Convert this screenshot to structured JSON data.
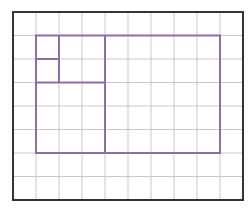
{
  "diagram": {
    "type": "grid-partition",
    "grid": {
      "columns": 10,
      "rows": 8,
      "origin_x": 13,
      "origin_y": 12,
      "cell_width": 23,
      "cell_height": 23.5,
      "gridline_color": "#c9c9c9",
      "border_color": "#333333"
    },
    "shapes": {
      "color": "#8a6fa0",
      "outer_rect": {
        "col": 1,
        "row": 1,
        "cols": 8,
        "rows": 5
      },
      "segments": [
        {
          "name": "divider-vertical-main",
          "x1c": 4,
          "y1r": 1,
          "x2c": 4,
          "y2r": 6
        },
        {
          "name": "divider-vertical-small",
          "x1c": 2,
          "y1r": 1,
          "x2c": 2,
          "y2r": 3
        },
        {
          "name": "divider-horizontal-small",
          "x1c": 1,
          "y1r": 2,
          "x2c": 2,
          "y2r": 2
        },
        {
          "name": "divider-horizontal-medium",
          "x1c": 1,
          "y1r": 3,
          "x2c": 4,
          "y2r": 3
        }
      ]
    }
  }
}
